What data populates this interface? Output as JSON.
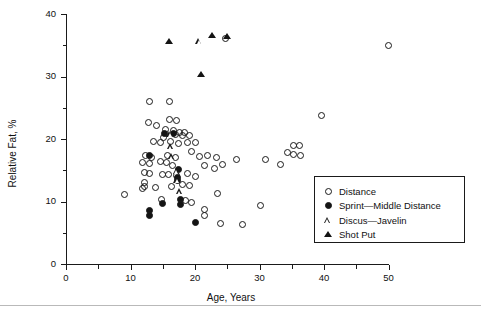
{
  "chart_data": {
    "type": "scatter",
    "title": "",
    "xlabel": "Age, Years",
    "ylabel": "Relative Fat, %",
    "xlim": [
      0,
      50
    ],
    "ylim": [
      0,
      40
    ],
    "xticks": [
      0,
      10,
      20,
      30,
      40,
      50
    ],
    "xticklabels": [
      "0",
      "10",
      "20",
      "30",
      "40",
      "50"
    ],
    "xminorticks": [
      5,
      15,
      25,
      35,
      45
    ],
    "yticks": [
      0,
      10,
      20,
      30,
      40
    ],
    "yticklabels": [
      "0",
      "10",
      "20",
      "30",
      "40"
    ],
    "yminorticks": [
      5,
      15,
      25,
      35
    ],
    "grid": false,
    "legend_position": "lower-right",
    "series": [
      {
        "name": "Distance",
        "marker": "open-circle",
        "points": [
          [
            13.0,
            26.0
          ],
          [
            16.0,
            26.0
          ],
          [
            24.7,
            36.1
          ],
          [
            50.0,
            35.0
          ],
          [
            39.6,
            23.7
          ],
          [
            12.8,
            22.6
          ],
          [
            14.0,
            22.2
          ],
          [
            16.1,
            23.1
          ],
          [
            17.2,
            22.9
          ],
          [
            15.4,
            21.6
          ],
          [
            16.6,
            21.4
          ],
          [
            17.6,
            21.1
          ],
          [
            18.4,
            21.0
          ],
          [
            16.9,
            20.7
          ],
          [
            18.1,
            20.6
          ],
          [
            19.1,
            20.5
          ],
          [
            15.1,
            20.2
          ],
          [
            13.6,
            19.6
          ],
          [
            14.7,
            19.4
          ],
          [
            16.2,
            19.6
          ],
          [
            17.4,
            19.3
          ],
          [
            18.9,
            19.5
          ],
          [
            20.0,
            19.4
          ],
          [
            19.4,
            18.0
          ],
          [
            12.3,
            17.3
          ],
          [
            13.2,
            17.0
          ],
          [
            15.8,
            17.4
          ],
          [
            17.0,
            17.1
          ],
          [
            20.7,
            17.2
          ],
          [
            22.0,
            17.3
          ],
          [
            23.3,
            17.0
          ],
          [
            26.5,
            16.8
          ],
          [
            11.8,
            16.3
          ],
          [
            12.9,
            16.1
          ],
          [
            14.6,
            16.4
          ],
          [
            15.6,
            16.2
          ],
          [
            16.5,
            15.8
          ],
          [
            21.5,
            15.7
          ],
          [
            23.0,
            15.3
          ],
          [
            24.2,
            15.9
          ],
          [
            12.1,
            14.7
          ],
          [
            13.0,
            14.5
          ],
          [
            14.9,
            14.3
          ],
          [
            15.9,
            14.4
          ],
          [
            17.1,
            14.2
          ],
          [
            18.8,
            14.5
          ],
          [
            20.1,
            14.0
          ],
          [
            12.2,
            13.0
          ],
          [
            12.2,
            12.4
          ],
          [
            13.8,
            12.3
          ],
          [
            11.9,
            12.1
          ],
          [
            16.3,
            12.4
          ],
          [
            18.0,
            12.7
          ],
          [
            19.2,
            12.5
          ],
          [
            9.0,
            11.2
          ],
          [
            23.5,
            11.3
          ],
          [
            14.8,
            10.3
          ],
          [
            18.6,
            10.2
          ],
          [
            19.5,
            9.9
          ],
          [
            21.4,
            8.7
          ],
          [
            21.4,
            7.7
          ],
          [
            24.0,
            6.5
          ],
          [
            27.3,
            6.3
          ],
          [
            30.2,
            9.4
          ],
          [
            31.0,
            16.7
          ],
          [
            34.3,
            17.9
          ],
          [
            35.3,
            18.9
          ],
          [
            36.2,
            18.9
          ],
          [
            35.2,
            17.6
          ],
          [
            36.3,
            17.4
          ],
          [
            33.3,
            15.9
          ]
        ]
      },
      {
        "name": "Sprint—Middle Distance",
        "marker": "filled-circle",
        "points": [
          [
            13.0,
            17.3
          ],
          [
            17.5,
            15.1
          ],
          [
            17.3,
            13.9
          ],
          [
            17.3,
            13.3
          ],
          [
            17.8,
            10.3
          ],
          [
            17.8,
            9.6
          ],
          [
            14.9,
            9.7
          ],
          [
            13.0,
            8.5
          ],
          [
            13.0,
            7.8
          ],
          [
            20.0,
            6.6
          ],
          [
            15.3,
            20.9
          ],
          [
            16.6,
            20.9
          ]
        ]
      },
      {
        "name": "Discus—Javelin",
        "marker": "open-triangle",
        "points": [
          [
            20.7,
            35.7
          ],
          [
            16.2,
            20.8
          ],
          [
            16.3,
            18.8
          ],
          [
            16.4,
            17.2
          ],
          [
            17.2,
            14.9
          ],
          [
            17.3,
            13.5
          ],
          [
            17.7,
            11.6
          ]
        ]
      },
      {
        "name": "Shot Put",
        "marker": "filled-triangle",
        "points": [
          [
            16.0,
            35.6
          ],
          [
            22.6,
            36.5
          ],
          [
            21.0,
            30.3
          ],
          [
            25.0,
            36.4
          ]
        ]
      }
    ]
  },
  "legend": {
    "entries": [
      {
        "label": "Distance",
        "marker": "open-circle"
      },
      {
        "label": "Sprint—Middle Distance",
        "marker": "filled-circle"
      },
      {
        "label": "Discus—Javelin",
        "marker": "open-triangle"
      },
      {
        "label": "Shot Put",
        "marker": "filled-triangle"
      }
    ]
  },
  "axes": {
    "x_title": "Age, Years",
    "y_title": "Relative Fat, %"
  },
  "colors": {
    "ink": "#1a1a1a",
    "background": "#ffffff",
    "rule": "#b9b9b9"
  }
}
